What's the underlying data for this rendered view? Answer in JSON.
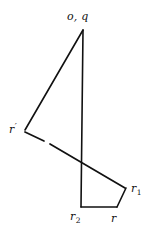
{
  "figure": {
    "title": "o, q",
    "background_color": "#ffffff",
    "stroke_color": "#111111",
    "canvas": {
      "width": 156,
      "height": 240
    },
    "labels": {
      "apex": "o, q",
      "left_vertex_base": "r",
      "left_vertex_prime": "′",
      "right_vertex_base": "r",
      "right_vertex_sub": "1",
      "bottom_left_base": "r",
      "bottom_left_sub": "2",
      "bottom_right": "r"
    },
    "points": {
      "apex": {
        "x": 83,
        "y": 30,
        "name": "o, q"
      },
      "r_prime": {
        "x": 24,
        "y": 131,
        "name": "r'"
      },
      "r1": {
        "x": 125,
        "y": 188,
        "name": "r1"
      },
      "r2": {
        "x": 81,
        "y": 207,
        "name": "r2"
      },
      "r": {
        "x": 117,
        "y": 207,
        "name": "r"
      },
      "crossing": {
        "x": 82,
        "y": 167,
        "name": "crossing"
      }
    },
    "edges": [
      {
        "name": "apex-to-r2-vertical",
        "from": "apex",
        "to": "r2",
        "style": "solid"
      },
      {
        "name": "apex-to-rprime",
        "from": "apex",
        "to": "r_prime",
        "style": "solid"
      },
      {
        "name": "rprime-to-r1",
        "from": "r_prime",
        "to": "r1",
        "style": "broken"
      },
      {
        "name": "r2-to-r-bottom",
        "from": "r2",
        "to": "r",
        "style": "solid"
      },
      {
        "name": "r-to-r1",
        "from": "r",
        "to": "r1",
        "style": "solid"
      }
    ]
  }
}
